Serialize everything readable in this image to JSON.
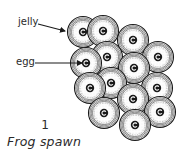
{
  "figure": {
    "number": "1",
    "caption": "Frog spawn"
  },
  "labels": {
    "jelly": {
      "text": "jelly",
      "arrow_from": [
        38,
        24
      ],
      "arrow_to": [
        65,
        31
      ]
    },
    "egg": {
      "text": "egg",
      "arrow_from": [
        35,
        63
      ],
      "arrow_to": [
        82,
        63
      ]
    }
  },
  "spawn": {
    "jelly_radius": 15.5,
    "egg_radius": 4.2,
    "colors": {
      "ink": "#1a1a1a",
      "ring": "#555555",
      "stipple": "#9a9a9a",
      "jelly_fill": "#f4f4f4"
    },
    "eggs": [
      {
        "x": 83,
        "y": 32
      },
      {
        "x": 103,
        "y": 31
      },
      {
        "x": 133,
        "y": 40
      },
      {
        "x": 158,
        "y": 57
      },
      {
        "x": 107,
        "y": 57
      },
      {
        "x": 86,
        "y": 63
      },
      {
        "x": 134,
        "y": 68
      },
      {
        "x": 111,
        "y": 83
      },
      {
        "x": 90,
        "y": 88
      },
      {
        "x": 157,
        "y": 88
      },
      {
        "x": 133,
        "y": 99
      },
      {
        "x": 104,
        "y": 113
      },
      {
        "x": 160,
        "y": 112
      },
      {
        "x": 135,
        "y": 125
      }
    ]
  }
}
